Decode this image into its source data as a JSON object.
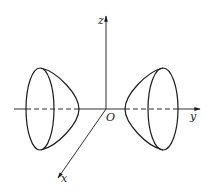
{
  "figure": {
    "colors": {
      "background": "#ffffff",
      "stroke": "#1a1a1a"
    },
    "axes": {
      "x": {
        "label": "x"
      },
      "y": {
        "label": "y"
      },
      "z": {
        "label": "z"
      },
      "origin": {
        "label": "O"
      }
    },
    "surfaces": [
      {
        "name": "left-sheet",
        "side": "negative-y"
      },
      {
        "name": "right-sheet",
        "side": "positive-y"
      }
    ]
  }
}
